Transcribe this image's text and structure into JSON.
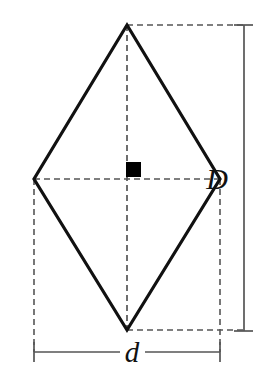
{
  "figure": {
    "shape_name": "rhombus",
    "labels": {
      "major_diagonal": "D",
      "minor_diagonal": "d"
    },
    "label_font_size_major": 30,
    "label_font_size_minor": 29,
    "colors": {
      "outline": "#111111",
      "dashed": "#555555",
      "dimension": "#555555",
      "right_angle_marker": "#000000",
      "background": "#ffffff"
    },
    "geometry": {
      "vertex_top": [
        127,
        25
      ],
      "vertex_right": [
        220,
        179
      ],
      "vertex_bottom": [
        127,
        330
      ],
      "vertex_left": [
        34,
        179
      ],
      "center": [
        127,
        179
      ],
      "outline_stroke_width": 3.2,
      "dash_pattern": "6,4",
      "right_angle_marker": {
        "x": 126,
        "y": 162,
        "width": 15,
        "height": 15
      },
      "dimension_major": {
        "axis_x": 244,
        "y_top": 25,
        "y_bottom": 331,
        "tick_x_start": 234,
        "tick_x_end": 253,
        "label_x": 228,
        "label_y": 189
      },
      "dimension_minor": {
        "axis_y": 352,
        "x_left": 34,
        "x_right": 220,
        "tick_y_start": 342,
        "tick_y_end": 362,
        "label_x": 122,
        "label_y": 362
      },
      "extension_lines": {
        "top_horizontal": {
          "x1": 127,
          "y1": 25,
          "x2": 244,
          "y2": 25
        },
        "bottom_horizontal": {
          "x1": 127,
          "y1": 330,
          "x2": 244,
          "y2": 330
        },
        "left_vertical": {
          "x1": 34,
          "y1": 179,
          "x2": 34,
          "y2": 352
        },
        "right_vertical": {
          "x1": 220,
          "y1": 179,
          "x2": 220,
          "y2": 352
        }
      }
    }
  }
}
